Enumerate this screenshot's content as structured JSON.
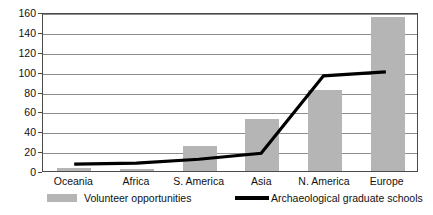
{
  "chart_data": {
    "type": "bar",
    "title": "",
    "subtitle": "",
    "xlabel": "",
    "ylabel": "",
    "categories": [
      "Oceania",
      "Africa",
      "S. America",
      "Asia",
      "N. America",
      "Europe"
    ],
    "ylim": [
      0,
      160
    ],
    "yticks": [
      0,
      20,
      40,
      60,
      80,
      100,
      120,
      140,
      160
    ],
    "grid": "horizontal",
    "legend_position": "bottom",
    "series": [
      {
        "name": "Volunteer opportunities",
        "type": "bar",
        "color": "#b5b5b5",
        "values": [
          3,
          2,
          25,
          52,
          82,
          155
        ]
      },
      {
        "name": "Archaeological graduate schools",
        "type": "line",
        "color": "#000000",
        "values": [
          7,
          8,
          12,
          18,
          97,
          101
        ]
      }
    ]
  },
  "axis": {
    "y_tick_labels": [
      "0",
      "20",
      "40",
      "60",
      "80",
      "100",
      "120",
      "140",
      "160"
    ],
    "x_tick_labels": [
      "Oceania",
      "Africa",
      "S. America",
      "Asia",
      "N. America",
      "Europe"
    ]
  },
  "legend": {
    "items": [
      {
        "label": "Volunteer opportunities",
        "swatch": "bar-swatch",
        "color": "#b5b5b5"
      },
      {
        "label": "Archaeological graduate schools",
        "swatch": "line-swatch",
        "color": "#000000"
      }
    ]
  },
  "colors": {
    "bar": "#b5b5b5",
    "line": "#000000",
    "grid": "#8c8c8c",
    "frame": "#4a4a4a",
    "background": "#ffffff",
    "text": "#111111"
  }
}
